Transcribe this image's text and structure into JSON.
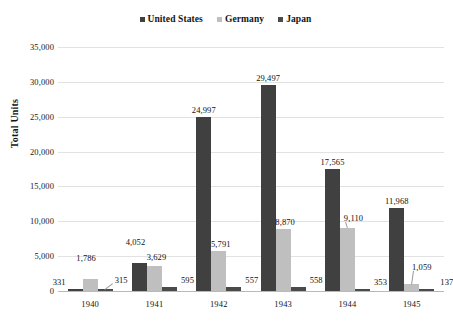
{
  "chart_data": {
    "type": "bar",
    "title": "",
    "xlabel": "",
    "ylabel": "Total Units",
    "ylim": [
      0,
      35000
    ],
    "ytick_labels": [
      "35,000",
      "30,000",
      "25,000",
      "20,000",
      "15,000",
      "10,000",
      "5,000",
      "0"
    ],
    "ytick_values": [
      35000,
      30000,
      25000,
      20000,
      15000,
      10000,
      5000,
      0
    ],
    "grid": true,
    "legend_position": "top-right",
    "categories": [
      "1940",
      "1941",
      "1942",
      "1943",
      "1944",
      "1945"
    ],
    "series": [
      {
        "name": "United States",
        "color": "#404040",
        "values": [
          331,
          4052,
          24997,
          29497,
          17565,
          11968
        ],
        "labels": [
          "331",
          "4,052",
          "24,997",
          "29,497",
          "17,565",
          "11,968"
        ]
      },
      {
        "name": "Germany",
        "color": "#bfbfbf",
        "values": [
          1786,
          3629,
          5791,
          8870,
          9110,
          1059
        ],
        "labels": [
          "1,786",
          "3,629",
          "5,791",
          "8,870",
          "9,110",
          "1,059"
        ]
      },
      {
        "name": "Japan",
        "color": "#4a4a4a",
        "values": [
          315,
          595,
          557,
          558,
          353,
          137
        ],
        "labels": [
          "315",
          "595",
          "557",
          "558",
          "353",
          "137"
        ]
      }
    ]
  },
  "legend": {
    "entries": [
      {
        "label": "United States",
        "color": "#404040"
      },
      {
        "label": "Germany",
        "color": "#bfbfbf"
      },
      {
        "label": "Japan",
        "color": "#4a4a4a"
      }
    ]
  }
}
